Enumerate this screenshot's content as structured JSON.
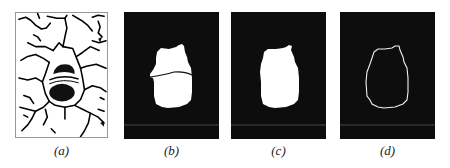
{
  "figure": {
    "panels": [
      {
        "id": "a",
        "label": "(a)",
        "description": "edge map with watershed regions, dark blob in center"
      },
      {
        "id": "b",
        "label": "(b)",
        "description": "binary segmentation with split line"
      },
      {
        "id": "c",
        "label": "(c)",
        "description": "merged binary region"
      },
      {
        "id": "d",
        "label": "(d)",
        "description": "region contour"
      }
    ],
    "colors": {
      "background": "#0d0d0d",
      "foreground": "#ffffff",
      "edge": "#000000"
    }
  }
}
